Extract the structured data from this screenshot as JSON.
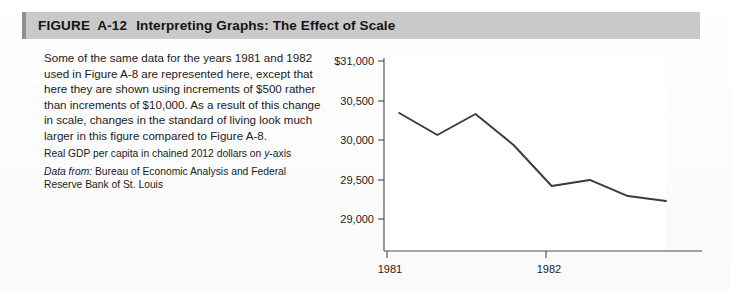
{
  "figure": {
    "label": "FIGURE",
    "number": "A-12",
    "caption": "Interpreting Graphs: The Effect of Scale",
    "header_bg": "#c9c9c9",
    "accent_color": "#8f8f8f"
  },
  "text": {
    "body": "Some of the same data for the years 1981 and 1982 used in Figure A-8 are represented here, except that here they are shown using increments of $500 rather than increments of $10,000. As a result of this change in scale, changes in the standard of living look much larger in this figure compared to Figure A-8.",
    "axis_note_plain": "Real GDP per capita in chained 2012 dollars on ",
    "axis_note_italic": "y",
    "axis_note_tail": "-axis",
    "source_label": "Data from:",
    "source_body": " Bureau of Economic Analysis and Federal Reserve Bank of St. Louis"
  },
  "chart_data": {
    "type": "line",
    "title": "",
    "xlabel": "",
    "ylabel": "Real GDP per capita in chained 2012 dollars",
    "x_tick_labels": [
      "1981",
      "1982"
    ],
    "x_tick_values": [
      1981,
      1982
    ],
    "y_tick_labels": [
      "$31,000",
      "30,500",
      "30,000",
      "29,500",
      "29,000"
    ],
    "y_tick_values": [
      31000,
      30500,
      30000,
      29500,
      29000
    ],
    "ylim": [
      28700,
      31000
    ],
    "xlim": [
      1980.9,
      1982.75
    ],
    "grid": false,
    "legend": null,
    "line_color": "#3a3a3a",
    "series": [
      {
        "name": "Real GDP per capita",
        "x": [
          1981.0,
          1981.25,
          1981.5,
          1981.75,
          1982.0,
          1982.25,
          1982.5,
          1982.75
        ],
        "values": [
          30342,
          30063,
          30329,
          29937,
          29418,
          29494,
          29291,
          29228
        ]
      }
    ]
  }
}
